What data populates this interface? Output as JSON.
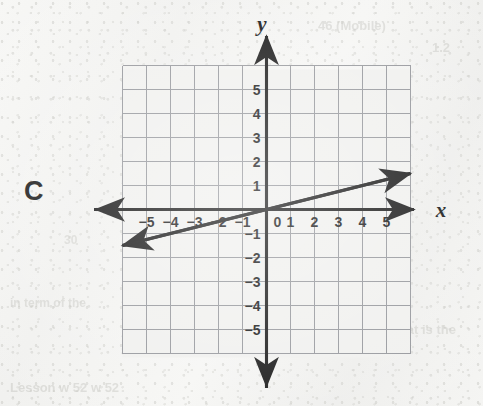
{
  "page": {
    "background_color": "#f4f4f2",
    "ink_color": "#151515",
    "grid_color": "#8f9196"
  },
  "choice": {
    "letter": "C"
  },
  "bleed_through_text": [
    {
      "text": "46 (Mobile)",
      "x": 318,
      "y": 18,
      "size": 13,
      "flip": false
    },
    {
      "text": "1.2",
      "x": 432,
      "y": 40,
      "size": 13,
      "flip": false
    },
    {
      "text": "30",
      "x": 64,
      "y": 233,
      "size": 12,
      "flip": false
    },
    {
      "text": "the perimeter",
      "x": 292,
      "y": 283,
      "size": 13,
      "flip": false
    },
    {
      "text": "of the rectangle is",
      "x": 286,
      "y": 300,
      "size": 13,
      "flip": false
    },
    {
      "text": "Origins w is 3.5. What is the",
      "x": 284,
      "y": 322,
      "size": 13,
      "flip": false
    },
    {
      "text": "in term of the",
      "x": 10,
      "y": 296,
      "size": 12,
      "flip": false
    },
    {
      "text": "Lesson w 52 w 52",
      "x": 10,
      "y": 380,
      "size": 13,
      "flip": false
    }
  ],
  "chart_data": {
    "type": "line",
    "title": "",
    "xlabel": "x",
    "ylabel": "y",
    "xlim": [
      -6,
      6
    ],
    "ylim": [
      -6,
      6
    ],
    "grid": true,
    "grid_step": 1,
    "legend": "none",
    "x_tick_labels": [
      "−5",
      "−4",
      "−3",
      "−2",
      "−1",
      "0",
      "1",
      "2",
      "3",
      "4",
      "5"
    ],
    "x_tick_values": [
      -5,
      -4,
      -3,
      -2,
      -1,
      0,
      1,
      2,
      3,
      4,
      5
    ],
    "y_tick_labels": [
      "5",
      "4",
      "3",
      "2",
      "1",
      "−1",
      "−2",
      "−3",
      "−4",
      "−5"
    ],
    "y_tick_values": [
      5,
      4,
      3,
      2,
      1,
      -1,
      -2,
      -3,
      -4,
      -5
    ],
    "origin_label": "0",
    "series": [
      {
        "name": "line",
        "equation": "y = 0.25x",
        "slope": 0.25,
        "intercept": 0,
        "arrows": "both",
        "points": [
          {
            "x": -6,
            "y": -1.5
          },
          {
            "x": 0,
            "y": 0
          },
          {
            "x": 6,
            "y": 1.5
          }
        ]
      }
    ]
  }
}
